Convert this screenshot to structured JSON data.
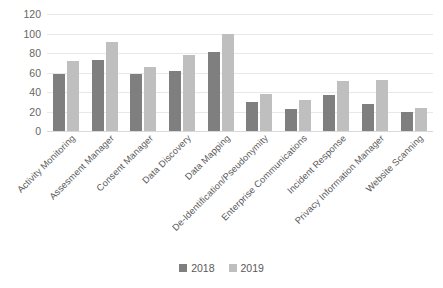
{
  "chart_data": {
    "type": "bar",
    "title": "",
    "subtitle": "",
    "xlabel": "",
    "ylabel": "",
    "ylim": [
      0,
      120
    ],
    "ytick_values": [
      0,
      20,
      40,
      60,
      80,
      100,
      120
    ],
    "ytick_labels": [
      "0",
      "20",
      "40",
      "60",
      "80",
      "100",
      "120"
    ],
    "grid": true,
    "legend_position": "bottom",
    "categories": [
      "Activity Monitoring",
      "Assesment Manager",
      "Consent Manager",
      "Data Discovery",
      "Data Mapping",
      "De-Identification/Pseudonymity",
      "Enterprise Communications",
      "Incident Response",
      "Privacy Information Manager",
      "Website Scanning"
    ],
    "series": [
      {
        "name": "2018",
        "color": "#7f7f7f",
        "values": [
          58,
          73,
          58,
          62,
          81,
          30,
          23,
          37,
          28,
          20
        ]
      },
      {
        "name": "2019",
        "color": "#bfbfbf",
        "values": [
          72,
          91,
          66,
          78,
          100,
          38,
          32,
          51,
          52,
          24
        ]
      }
    ],
    "legend": [
      "2018",
      "2019"
    ],
    "colors": {
      "series_2018": "#7f7f7f",
      "series_2019": "#bfbfbf",
      "gridline": "#e8e8e8",
      "axis_text": "#666666",
      "background": "#ffffff"
    }
  }
}
